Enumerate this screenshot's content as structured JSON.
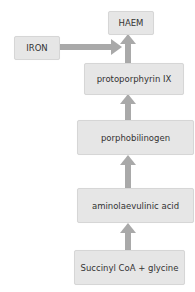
{
  "diagram": {
    "colors": {
      "box_fill": "#e6e6e6",
      "box_border": "#d6d6d6",
      "arrow": "#a9a9a9",
      "text": "#333333"
    },
    "nodes": [
      {
        "id": "haem",
        "label": "HAEM"
      },
      {
        "id": "iron",
        "label": "IRON"
      },
      {
        "id": "protoporphyrin",
        "label": "protoporphyrin IX"
      },
      {
        "id": "porphobilinogen",
        "label": "porphobilinogen"
      },
      {
        "id": "ala",
        "label": "aminolaevulinic acid"
      },
      {
        "id": "succinyl",
        "label": "Succinyl CoA + glycine"
      }
    ],
    "edges": [
      {
        "from": "iron",
        "to": "haem"
      },
      {
        "from": "protoporphyrin",
        "to": "haem"
      },
      {
        "from": "porphobilinogen",
        "to": "protoporphyrin"
      },
      {
        "from": "ala",
        "to": "porphobilinogen"
      },
      {
        "from": "succinyl",
        "to": "ala"
      }
    ]
  }
}
